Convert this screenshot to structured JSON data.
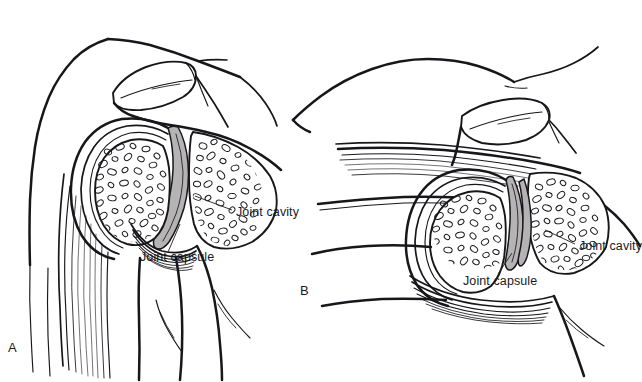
{
  "figure": {
    "type": "anatomical-line-drawing",
    "background_color": "#ffffff",
    "ink_color": "#17161a",
    "cavity_fill_color": "#b5b3b4",
    "width": 642,
    "height": 382
  },
  "panels": [
    {
      "letter": "A",
      "letter_x": 8,
      "letter_y": 340,
      "description": "Anterior shoulder, arm adducted at side",
      "labels": [
        {
          "id": "a-joint-cavity",
          "text": "Joint cavity",
          "x": 236,
          "y": 211
        },
        {
          "id": "a-joint-capsule",
          "text": "Joint capsule",
          "x": 140,
          "y": 256
        }
      ]
    },
    {
      "letter": "B",
      "letter_x": 300,
      "letter_y": 283,
      "description": "Shoulder with arm abducted overhead",
      "labels": [
        {
          "id": "b-joint-cavity",
          "text": "Joint cavity",
          "x": 579,
          "y": 245
        },
        {
          "id": "b-joint-capsule",
          "text": "Joint capsule",
          "x": 463,
          "y": 280
        }
      ]
    }
  ],
  "structures": {
    "humeral_head": "trabecular bone, stippled ellipse texture",
    "glenoid_scapula": "trabecular bone, stippled ellipse texture",
    "acromion": "oval bone process superior to joint",
    "joint_cavity": "gray crescent between humeral head and glenoid",
    "joint_capsule": "fibrous concentric lines at inferior joint",
    "muscle_striations": "fine parallel lines in arm and tendon"
  }
}
